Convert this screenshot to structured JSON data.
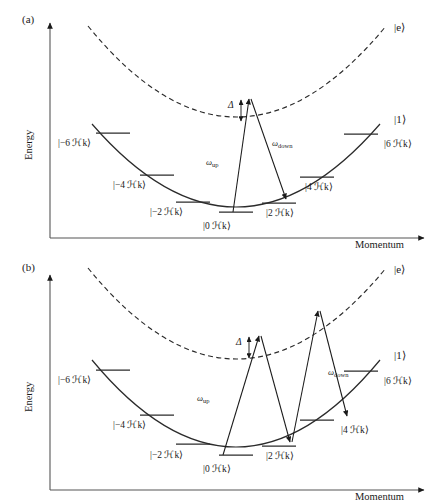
{
  "figure": {
    "background": "#ffffff",
    "ink": "#1a1a1a",
    "line_color": "#2b2b2b",
    "panels": [
      {
        "tag": "(a)",
        "axes": {
          "x_label": "Momentum",
          "y_label": "Energy"
        },
        "curves": [
          {
            "name": "ground-state-parabola",
            "state_label": "|1⟩",
            "style": "solid"
          },
          {
            "name": "excited-state-parabola",
            "state_label": "|e⟩",
            "style": "dashed"
          }
        ],
        "detuning_label": "Δ",
        "transitions": [
          {
            "name": "omega-up",
            "label": "ω",
            "sub": "up",
            "from": "|0 ℋk⟩",
            "to": "virtual"
          },
          {
            "name": "omega-down",
            "label": "ω",
            "sub": "down",
            "from": "virtual",
            "to": "|2 ℋk⟩"
          }
        ],
        "momentum_levels": [
          {
            "id": "m6",
            "label": "|−6 ℋk⟩"
          },
          {
            "id": "m4",
            "label": "|−4 ℋk⟩"
          },
          {
            "id": "m2",
            "label": "|−2 ℋk⟩"
          },
          {
            "id": "p0",
            "label": "|0 ℋk⟩"
          },
          {
            "id": "p2",
            "label": "|2 ℋk⟩"
          },
          {
            "id": "p4",
            "label": "|4 ℋk⟩"
          },
          {
            "id": "p6",
            "label": "|6 ℋk⟩"
          }
        ]
      },
      {
        "tag": "(b)",
        "axes": {
          "x_label": "Momentum",
          "y_label": "Energy"
        },
        "curves": [
          {
            "name": "ground-state-parabola",
            "state_label": "|1⟩",
            "style": "solid"
          },
          {
            "name": "excited-state-parabola",
            "state_label": "|e⟩",
            "style": "dashed"
          }
        ],
        "detuning_label": "Δ",
        "transitions": [
          {
            "name": "omega-up",
            "label": "ω",
            "sub": "up",
            "from": "|0 ℋk⟩",
            "to": "virtual-1"
          },
          {
            "name": "omega-down-1",
            "label": "",
            "sub": "",
            "from": "virtual-1",
            "to": "|2 ℋk⟩"
          },
          {
            "name": "omega-up-2",
            "label": "",
            "sub": "",
            "from": "|2 ℋk⟩",
            "to": "virtual-2"
          },
          {
            "name": "omega-down",
            "label": "ω",
            "sub": "down",
            "from": "virtual-2",
            "to": "|4 ℋk⟩"
          }
        ],
        "momentum_levels": [
          {
            "id": "m6",
            "label": "|−6 ℋk⟩"
          },
          {
            "id": "m4",
            "label": "|−4 ℋk⟩"
          },
          {
            "id": "m2",
            "label": "|−2 ℋk⟩"
          },
          {
            "id": "p0",
            "label": "|0 ℋk⟩"
          },
          {
            "id": "p2",
            "label": "|2 ℋk⟩"
          },
          {
            "id": "p4",
            "label": "|4 ℋk⟩"
          },
          {
            "id": "p6",
            "label": "|6 ℋk⟩"
          }
        ]
      }
    ]
  }
}
